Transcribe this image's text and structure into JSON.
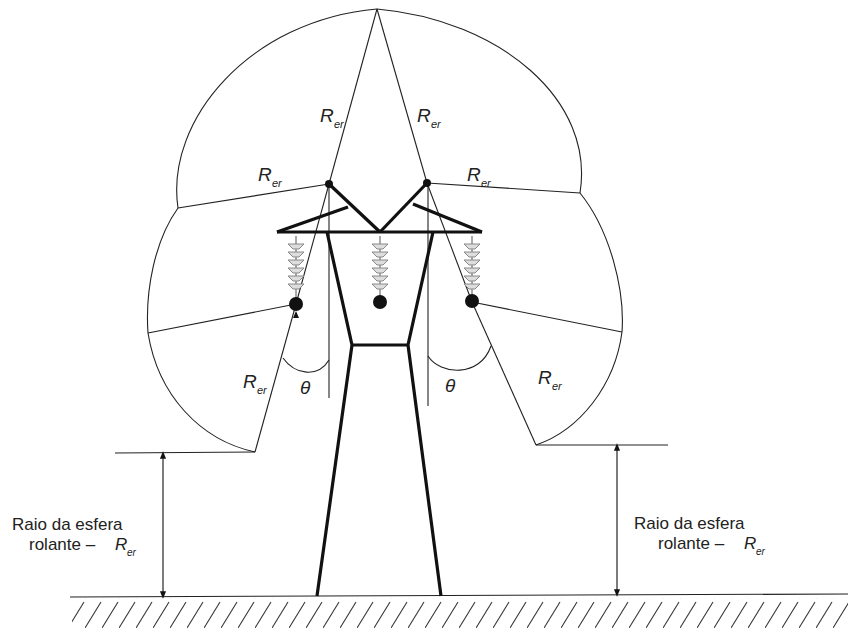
{
  "diagram": {
    "type": "rolling-sphere-protection",
    "labels": {
      "radius_symbol": "R",
      "radius_subscript": "er",
      "angle_symbol": "θ",
      "left_dimension_line1": "Raio da esfera",
      "left_dimension_line2": "rolante – ",
      "right_dimension_line1": "Raio da esfera",
      "right_dimension_line2": "rolante – "
    },
    "colors": {
      "line": "#222222",
      "tower": "#111111",
      "insulator": "#9a9a9a",
      "background": "#ffffff"
    }
  }
}
